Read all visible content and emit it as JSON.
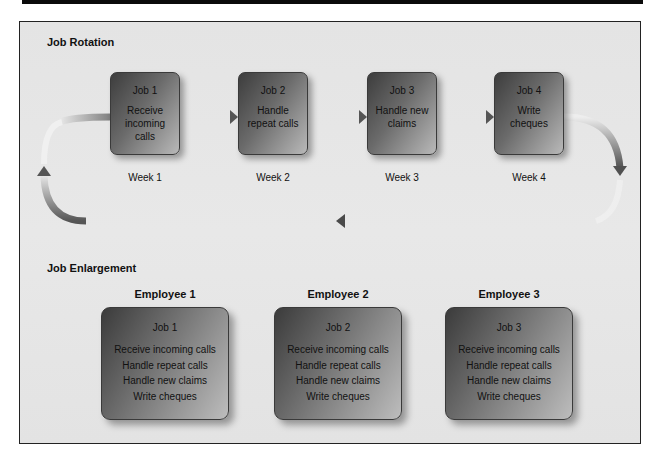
{
  "job_rotation": {
    "title": "Job Rotation",
    "jobs": [
      {
        "name": "Job 1",
        "task": "Receive incoming calls",
        "week": "Week 1"
      },
      {
        "name": "Job 2",
        "task": "Handle repeat calls",
        "week": "Week 2"
      },
      {
        "name": "Job 3",
        "task": "Handle new claims",
        "week": "Week 3"
      },
      {
        "name": "Job 4",
        "task": "Write cheques",
        "week": "Week 4"
      }
    ]
  },
  "job_enlargement": {
    "title": "Job Enlargement",
    "employees": [
      {
        "label": "Employee 1",
        "job": "Job 1",
        "tasks": [
          "Receive incoming calls",
          "Handle repeat calls",
          "Handle new claims",
          "Write cheques"
        ]
      },
      {
        "label": "Employee 2",
        "job": "Job 2",
        "tasks": [
          "Receive incoming calls",
          "Handle repeat calls",
          "Handle new claims",
          "Write cheques"
        ]
      },
      {
        "label": "Employee 3",
        "job": "Job 3",
        "tasks": [
          "Receive incoming calls",
          "Handle repeat calls",
          "Handle new claims",
          "Write cheques"
        ]
      }
    ]
  },
  "colors": {
    "panel_bg": "#e6e6e6",
    "arrow": "#555555",
    "box_dark": "#3d3d3d",
    "box_light": "#bdbdbd",
    "top_bar": "#0a0a0a"
  }
}
